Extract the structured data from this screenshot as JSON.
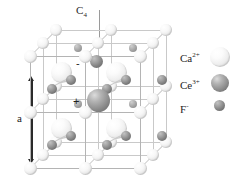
{
  "figure": {
    "type": "crystal-structure-diagram",
    "symmetry_axis_label": "C",
    "symmetry_axis_subscript": "4",
    "lattice_parameter_label": "a"
  },
  "charges": {
    "negative": "-",
    "positive": "+"
  },
  "legend": {
    "items": [
      {
        "name": "calcium-ion",
        "label": "Ca",
        "superscript": "2+",
        "species": "Ca2+",
        "color": "#efefef",
        "radius_px": 10
      },
      {
        "name": "cerium-ion",
        "label": "Ce",
        "superscript": "3+",
        "species": "Ce3+",
        "color": "#9a9a9a",
        "radius_px": 9
      },
      {
        "name": "fluoride-ion",
        "label": "F",
        "superscript": "-",
        "species": "F-",
        "color": "#8a8a8a",
        "radius_px": 5.5
      }
    ]
  },
  "colors": {
    "background": "#ffffff",
    "edge": "#b4b4b4",
    "edge_depth": "#c9c9c9",
    "axis": "#9a9a9a",
    "arrow": "#2a2a2a",
    "text": "#1f1f1f"
  }
}
